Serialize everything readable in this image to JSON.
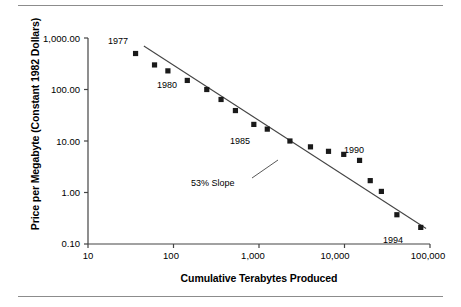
{
  "chart_data": {
    "type": "scatter",
    "title": "",
    "xlabel": "Cumulative Terabytes Produced",
    "ylabel": "Price per Megabyte (Constant 1982 Dollars)",
    "xscale": "log",
    "yscale": "log",
    "xlim": [
      10,
      100000
    ],
    "ylim": [
      0.1,
      1000
    ],
    "grid": false,
    "legend": null,
    "xticks": [
      {
        "value": 10,
        "label": "10"
      },
      {
        "value": 100,
        "label": "100"
      },
      {
        "value": 1000,
        "label": "1,000"
      },
      {
        "value": 10000,
        "label": "10,000"
      },
      {
        "value": 100000,
        "label": "100,000"
      }
    ],
    "yticks": [
      {
        "value": 1000,
        "label": "1,000.00"
      },
      {
        "value": 100,
        "label": "100.00"
      },
      {
        "value": 10,
        "label": "10.00"
      },
      {
        "value": 1,
        "label": "1.00"
      },
      {
        "value": 0.1,
        "label": "0.10"
      }
    ],
    "points": [
      {
        "x": 36,
        "y": 500,
        "year": 1977
      },
      {
        "x": 60,
        "y": 300,
        "year": 1978
      },
      {
        "x": 86,
        "y": 230,
        "year": 1979
      },
      {
        "x": 145,
        "y": 150,
        "year": 1980
      },
      {
        "x": 245,
        "y": 100,
        "year": 1981
      },
      {
        "x": 360,
        "y": 64,
        "year": 1982
      },
      {
        "x": 530,
        "y": 39,
        "year": 1983
      },
      {
        "x": 870,
        "y": 21,
        "year": 1984
      },
      {
        "x": 1250,
        "y": 17,
        "year": 1985
      },
      {
        "x": 2300,
        "y": 10,
        "year": 1986
      },
      {
        "x": 4000,
        "y": 7.7,
        "year": 1987
      },
      {
        "x": 6500,
        "y": 6.3,
        "year": 1988
      },
      {
        "x": 9800,
        "y": 5.5,
        "year": 1989
      },
      {
        "x": 15000,
        "y": 4.2,
        "year": 1990
      },
      {
        "x": 20000,
        "y": 1.7,
        "year": 1991
      },
      {
        "x": 27000,
        "y": 1.05,
        "year": 1992
      },
      {
        "x": 41000,
        "y": 0.37,
        "year": 1993
      },
      {
        "x": 78000,
        "y": 0.21,
        "year": 1994
      }
    ],
    "trendline": {
      "label": "53% Slope",
      "start": {
        "x": 45,
        "y": 700
      },
      "end": {
        "x": 90000,
        "y": 0.2
      }
    },
    "point_labels": [
      {
        "text": "1977",
        "x": 36,
        "y": 500
      },
      {
        "text": "1980",
        "x": 145,
        "y": 150
      },
      {
        "text": "1985",
        "x": 1250,
        "y": 17
      },
      {
        "text": "1990",
        "x": 15000,
        "y": 4.2
      },
      {
        "text": "1994",
        "x": 78000,
        "y": 0.21
      }
    ]
  },
  "axes": {
    "y_title": "Price per Megabyte (Constant 1982 Dollars)",
    "x_title": "Cumulative Terabytes Produced",
    "y_tick_labels": [
      "1,000.00",
      "100.00",
      "10.00",
      "1.00",
      "0.10"
    ],
    "x_tick_labels": [
      "10",
      "100",
      "1,000",
      "10,000",
      "100,000"
    ]
  },
  "annotations": {
    "slope": "53% Slope",
    "year_1977": "1977",
    "year_1980": "1980",
    "year_1985": "1985",
    "year_1990": "1990",
    "year_1994": "1994"
  },
  "colors": {
    "marker": "#1a1a1a",
    "axis": "#444444",
    "rule": "#8c8c8c",
    "text": "#000000",
    "background": "#ffffff"
  }
}
